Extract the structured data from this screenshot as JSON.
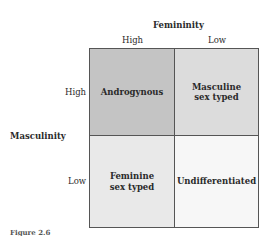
{
  "diagram": {
    "column_axis": {
      "title": "Femininity",
      "levels": [
        "High",
        "Low"
      ]
    },
    "row_axis": {
      "title": "Masculinity",
      "levels": [
        "High",
        "Low"
      ]
    },
    "cells": {
      "high_high": [
        "Androgynous"
      ],
      "high_low": [
        "Masculine",
        "sex typed"
      ],
      "low_high": [
        "Feminine",
        "sex typed"
      ],
      "low_low": [
        "Undifferentiated"
      ]
    },
    "colors": {
      "high_high": "#c4c4c4",
      "high_low": "#dcdcdc",
      "low_high": "#e9e9e9",
      "low_low": "#f7f7f7",
      "border": "#555555"
    },
    "caption": "Figure 2.6"
  }
}
